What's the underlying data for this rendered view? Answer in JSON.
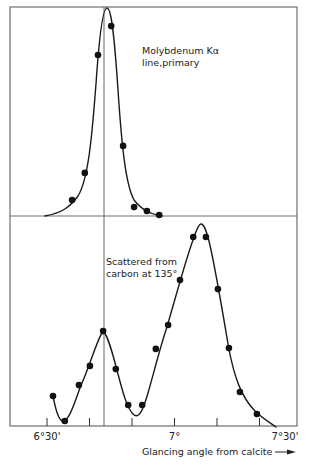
{
  "chart_data": [
    {
      "type": "scatter",
      "panel": "top",
      "title": "",
      "annotation": [
        "Molybdenum Kα",
        "line,primary"
      ],
      "xlabel": "Glancing angle from calcite",
      "ylabel": "",
      "x_units": "minutes of arc past 6°30'",
      "y_units": "relative intensity (0-100)",
      "series": [
        {
          "name": "Molybdenum Kα line, primary",
          "points": [
            {
              "x": 5.9,
              "y": 7.7
            },
            {
              "x": 8.9,
              "y": 20.7
            },
            {
              "x": 12.0,
              "y": 77.4
            },
            {
              "x": 15.1,
              "y": 91.3
            },
            {
              "x": 17.9,
              "y": 33.7
            },
            {
              "x": 20.5,
              "y": 4.3
            },
            {
              "x": 23.5,
              "y": 2.4
            },
            {
              "x": 26.4,
              "y": 0.5
            }
          ],
          "peak": {
            "x": 14.1,
            "y": 100
          }
        }
      ],
      "reference_line_x": 13.4
    },
    {
      "type": "scatter",
      "panel": "bottom",
      "title": "",
      "annotation": [
        "Scattered from",
        "carbon at 135°"
      ],
      "xlabel": "Glancing angle from calcite",
      "ylabel": "",
      "x_units": "minutes of arc past 6°30'",
      "y_units": "relative intensity (0-100)",
      "series": [
        {
          "name": "Scattered from carbon at 135°",
          "points": [
            {
              "x": 1.4,
              "y": 14.3
            },
            {
              "x": 4.2,
              "y": 2.4
            },
            {
              "x": 7.5,
              "y": 19.5
            },
            {
              "x": 10.1,
              "y": 28.6
            },
            {
              "x": 13.2,
              "y": 45.2
            },
            {
              "x": 16.2,
              "y": 27.1
            },
            {
              "x": 19.1,
              "y": 10.0
            },
            {
              "x": 22.4,
              "y": 10.0
            },
            {
              "x": 25.6,
              "y": 36.7
            },
            {
              "x": 28.5,
              "y": 48.1
            },
            {
              "x": 31.3,
              "y": 69.5
            },
            {
              "x": 34.4,
              "y": 90.0
            },
            {
              "x": 37.4,
              "y": 90.0
            },
            {
              "x": 40.2,
              "y": 65.2
            },
            {
              "x": 42.8,
              "y": 37.1
            },
            {
              "x": 45.4,
              "y": 16.2
            },
            {
              "x": 49.4,
              "y": 5.7
            }
          ],
          "peaks": [
            {
              "label": "unmodified",
              "x": 13.2,
              "y": 45.2
            },
            {
              "label": "modified",
              "x": 36.0,
              "y": 96.0
            }
          ]
        }
      ],
      "reference_line_x": 13.4
    }
  ],
  "axis": {
    "tick_labels": [
      {
        "label": "6°30'",
        "minutes": 0
      },
      {
        "label": "7°",
        "minutes": 30
      },
      {
        "label": "7°30'",
        "minutes": 60
      }
    ],
    "tick_minutes": [
      0,
      10,
      20,
      30,
      40,
      50
    ],
    "xlim_minutes": [
      -9,
      60
    ],
    "xlabel": "Glancing angle from calcite",
    "xlabel_arrow": "→"
  },
  "layout": {
    "frame": {
      "left": 10,
      "top": 7,
      "right": 297,
      "bottom": 426
    },
    "top_panel": {
      "baseline": 216,
      "top": 8
    },
    "bottom_panel": {
      "baseline": 426,
      "top": 216
    },
    "x0_px": 47,
    "px_per_minute": 4.25,
    "ref_line_px": 104
  },
  "curves": {
    "top": "M45,216 C62,213 70,207 78,196 C88,180 92,140 97,70 C100,30 103,8 107,8 C111,8 114,30 118,90 C122,150 126,185 134,200 C142,210 150,214 162,216",
    "bottom": "M53,396 C56,412 59,421 63,421 C70,421 76,397 82,383 C90,365 97,340 103,331 C108,335 113,355 118,374 C123,393 127,408 133,414 C139,420 143,410 148,393 C154,372 160,348 166,330 C175,300 185,262 193,240 C197,228 199,224 201,224 C204,224 206,230 209,241 C214,262 220,296 228,344 C234,378 242,398 255,411 C262,418 269,422 276,427"
  },
  "annotations": {
    "top_line1": "Molybdenum Kα",
    "top_line2": "line,primary",
    "bottom_line1": "Scattered from",
    "bottom_line2": "carbon at 135°"
  }
}
